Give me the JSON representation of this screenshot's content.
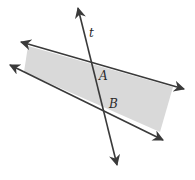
{
  "diagram": {
    "labels": {
      "transversal": "t",
      "point_a": "A",
      "point_b": "B"
    },
    "colors": {
      "line": "#3a3a3a",
      "shade": "#d9d9d9",
      "background": "#ffffff"
    },
    "shaded_region": "Region between the two lines"
  }
}
